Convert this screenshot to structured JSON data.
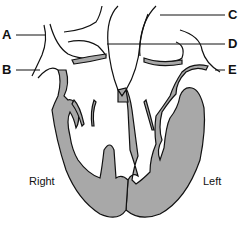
{
  "diagram": {
    "labels": {
      "A": "A",
      "B": "B",
      "C": "C",
      "D": "D",
      "E": "E"
    },
    "sides": {
      "right": "Right",
      "left": "Left"
    },
    "colors": {
      "muscle": "#a8a8a8",
      "outline": "#111111",
      "background": "#ffffff"
    }
  }
}
